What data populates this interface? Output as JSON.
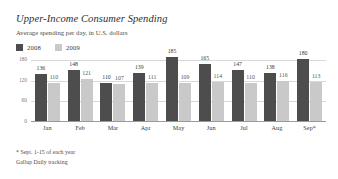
{
  "header": {
    "title": "Upper-Income Consumer Spending",
    "subtitle": "Average spending per day, in U.S. dollars"
  },
  "legend": {
    "position": "top-left",
    "items": [
      {
        "label": "2008",
        "color": "#4d4d4d",
        "swatch_name": "legend-swatch-2008"
      },
      {
        "label": "2009",
        "color": "#c9c9c9",
        "swatch_name": "legend-swatch-2009"
      }
    ]
  },
  "footnotes": [
    "* Sept. 1-15 of each year",
    "Gallup Daily tracking"
  ],
  "chart_data": {
    "type": "bar",
    "title": "Upper-Income Consumer Spending",
    "subtitle": "Average spending per day, in U.S. dollars",
    "xlabel": "",
    "ylabel": "",
    "ylim": [
      0,
      180
    ],
    "yticks": [
      180,
      120,
      60,
      0
    ],
    "grid": true,
    "categories": [
      "Jan",
      "Feb",
      "Mar",
      "Apr",
      "May",
      "Jun",
      "Jul",
      "Aug",
      "Sep*"
    ],
    "series": [
      {
        "name": "2008",
        "color": "#4d4d4d",
        "values": [
          136,
          148,
          110,
          139,
          185,
          165,
          147,
          138,
          180
        ]
      },
      {
        "name": "2009",
        "color": "#c9c9c9",
        "values": [
          110,
          121,
          107,
          111,
          109,
          114,
          110,
          116,
          113
        ]
      }
    ],
    "annotations": [
      "* Sept. 1-15 of each year",
      "Gallup Daily tracking"
    ]
  }
}
